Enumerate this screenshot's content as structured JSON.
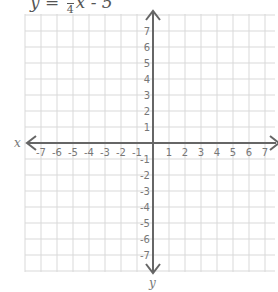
{
  "equation": {
    "lhs": "y",
    "equals": "=",
    "frac_num": "3",
    "frac_den": "4",
    "var": "x",
    "rest": "- 5"
  },
  "graph": {
    "x_axis_label": "x",
    "y_axis_label": "y",
    "x_ticks": [
      "-7",
      "-6",
      "-5",
      "-4",
      "-3",
      "-2",
      "-1",
      "1",
      "2",
      "3",
      "4",
      "5",
      "6",
      "7"
    ],
    "y_ticks": [
      "7",
      "6",
      "5",
      "4",
      "3",
      "2",
      "1",
      "-1",
      "-2",
      "-3",
      "-4",
      "-5",
      "-6",
      "-7"
    ],
    "x_range": [
      -7,
      7
    ],
    "y_range": [
      -7,
      7
    ],
    "grid": true,
    "grid_color": "#d9d9d9",
    "axis_color": "#666666"
  }
}
